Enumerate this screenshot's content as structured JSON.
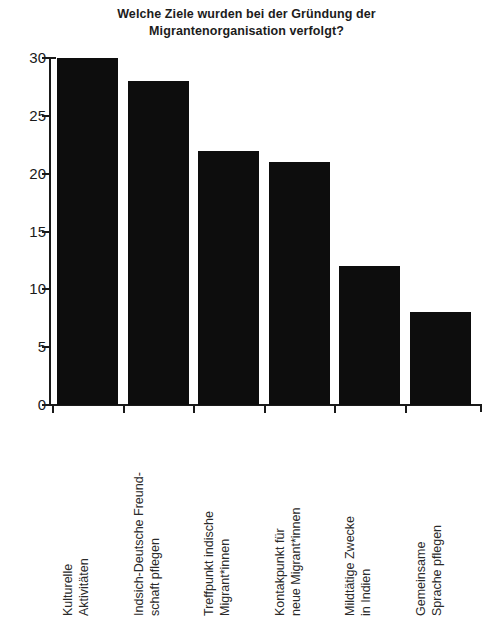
{
  "chart_data": {
    "type": "bar",
    "title": "Welche Ziele wurden bei der Gründung der Migrantenorganisation verfolgt?",
    "title_lines": [
      "Welche Ziele wurden bei der Gründung der",
      "Migrantenorganisation verfolgt?"
    ],
    "xlabel": "",
    "ylabel": "",
    "ylim": [
      0,
      30
    ],
    "grid": false,
    "legend": null,
    "categories": [
      "Kulturelle Aktivitäten",
      "Indsich-Deutsche Freundschaft pflegen",
      "Treffpunkt indische Migrant*innen",
      "Kontakpunkt für neue Migrant*innen",
      "Mildtätige Zwecke in Indien",
      "Gemeinsame Sprache pflegen"
    ],
    "category_lines": [
      [
        "Kulturelle",
        "Aktivitäten"
      ],
      [
        "Indsich-Deutsche Freund-",
        "schaft pflegen"
      ],
      [
        "Treffpunkt indische",
        "Migrant*innen"
      ],
      [
        "Kontakpunkt für",
        "neue Migrant*innen"
      ],
      [
        "Mildtätige Zwecke",
        "in Indien"
      ],
      [
        "Gemeinsame",
        "Sprache pflegen"
      ]
    ],
    "values": [
      30,
      28,
      22,
      21,
      12,
      8
    ],
    "yticks": [
      0,
      5,
      10,
      15,
      20,
      25,
      30
    ],
    "ytick_labels": [
      "0",
      "5",
      "10",
      "15",
      "20",
      "25",
      "30"
    ],
    "bar_color": "#0d0d0d",
    "axis_color": "#1a1a1a",
    "text_color": "#1c1c1c",
    "background": "#ffffff"
  }
}
